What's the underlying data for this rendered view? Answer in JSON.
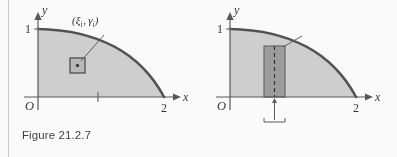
{
  "page": {
    "width": 397,
    "height": 157,
    "background": "#fdfdfc",
    "ink_color": "#2e2e2e",
    "region_fill": "#cfcfcf",
    "strip_fill": "#9a9a9a",
    "curve_color": "#4a4a4a"
  },
  "figures": [
    {
      "id": "figure-21-2-7",
      "caption": "Figure 21.2.7",
      "axes": {
        "y_axis_label": "y",
        "x_axis_label": "x",
        "origin_label": "O",
        "y_tick_labels": [
          "1"
        ],
        "x_tick_labels": [
          "2"
        ],
        "x_range": [
          0,
          2
        ],
        "y_range": [
          0,
          1
        ]
      },
      "curve": {
        "description": "quarter ellipse y = (1/2)sqrt(4 - x^2)",
        "shaded": true
      },
      "annotations": {
        "point_label_plain": "(ξᵢ , γᵢ)",
        "point_label_parts": {
          "open": "(",
          "first_symbol": "ξ",
          "first_sub": "i",
          "comma": ",",
          "second_symbol": "γ",
          "second_sub": "i",
          "close": ")"
        },
        "sample_marker": "small-square-with-center-dot",
        "leader_line": true,
        "x_axis_tick_mark": true
      }
    },
    {
      "id": "figure-21-2-8",
      "caption": "Figure 21.2.8",
      "axes": {
        "y_axis_label": "y",
        "x_axis_label": "x",
        "origin_label": "O",
        "y_tick_labels": [
          "1"
        ],
        "x_tick_labels": [
          "2"
        ],
        "x_range": [
          0,
          2
        ],
        "y_range": [
          0,
          1
        ]
      },
      "curve": {
        "description": "quarter ellipse y = (1/2)sqrt(4 - x^2)",
        "shaded": true
      },
      "annotations": {
        "point_label_plain": "(ξᵢ , ½√(4 − ξᵢ²))",
        "point_label_parts": {
          "open": "(",
          "first_symbol": "ξ",
          "first_sub": "i",
          "comma": ",",
          "fraction_numerator": "1",
          "fraction_denominator": "2",
          "radical_sign": "√",
          "radicand_prefix": "4 − ",
          "radicand_symbol": "ξ",
          "radicand_sub": "i",
          "radicand_sup": "2",
          "close": ")"
        },
        "strip_center_label": "ξ",
        "strip_center_sub": "i",
        "strip_width_label": "Δ",
        "strip_width_sub": "i",
        "strip_width_var": "x",
        "strip_dashed_center_line": true,
        "leader_line": true
      }
    }
  ]
}
